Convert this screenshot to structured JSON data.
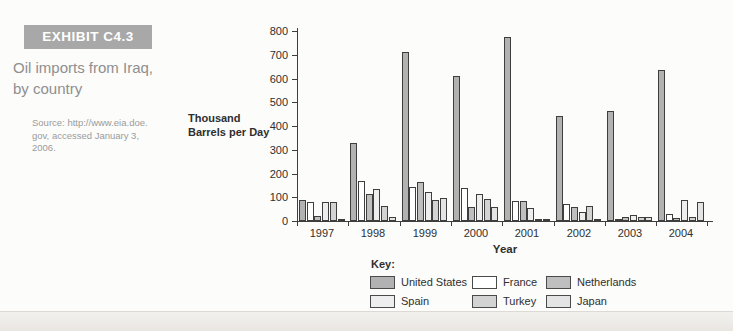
{
  "page": {
    "exhibit_label": "EXHIBIT C4.3",
    "title_line1": "Oil imports from Iraq,",
    "title_line2": "by country",
    "source_lines": [
      "Source: http://www.eia.doe.",
      "gov, accessed January 3,",
      "2006."
    ]
  },
  "chart_data": {
    "type": "bar",
    "title": "",
    "ylabel": "Thousand Barrels per Day",
    "ylabel_lines": [
      "Thousand",
      "Barrels per Day"
    ],
    "xlabel": "Year",
    "ylim": [
      0,
      800
    ],
    "yticks": [
      0,
      100,
      200,
      300,
      400,
      500,
      600,
      700,
      800
    ],
    "grid": false,
    "categories": [
      "1997",
      "1998",
      "1999",
      "2000",
      "2001",
      "2002",
      "2003",
      "2004"
    ],
    "series": [
      {
        "name": "United States",
        "color": "#b2b2b2",
        "values": [
          90,
          330,
          710,
          610,
          775,
          440,
          465,
          635
        ]
      },
      {
        "name": "France",
        "color": "#ffffff",
        "values": [
          80,
          170,
          145,
          140,
          85,
          70,
          5,
          28
        ]
      },
      {
        "name": "Netherlands",
        "color": "#bfbfbf",
        "values": [
          20,
          113,
          165,
          60,
          85,
          57,
          15,
          13
        ]
      },
      {
        "name": "Spain",
        "color": "#eeeeee",
        "values": [
          78,
          135,
          120,
          113,
          55,
          38,
          25,
          90
        ]
      },
      {
        "name": "Turkey",
        "color": "#d3d3d3",
        "values": [
          78,
          63,
          88,
          93,
          8,
          65,
          15,
          15
        ]
      },
      {
        "name": "Japan",
        "color": "#e4e4e4",
        "values": [
          8,
          17,
          97,
          57,
          10,
          8,
          15,
          80
        ]
      }
    ],
    "legend": {
      "title": "Key:",
      "position": "bottom",
      "rows": [
        [
          "United States",
          "France",
          "Netherlands"
        ],
        [
          "Spain",
          "Turkey",
          "Japan"
        ]
      ]
    }
  }
}
